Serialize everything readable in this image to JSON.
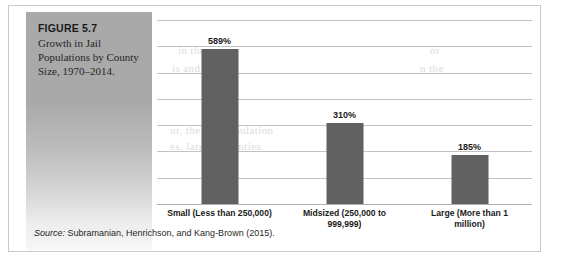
{
  "figure": {
    "number_label": "FIGURE 5.7",
    "caption": "Growth in Jail Populations by County Size, 1970–2014."
  },
  "source": {
    "label": "Source:",
    "citation": " Subramanian, Henrichson, and Kang-Brown (2015)."
  },
  "colors": {
    "bar": "#616161",
    "caption_panel": "#a9a9a9",
    "gridline": "#c2c2c2",
    "border": "#c9c9c9"
  },
  "bleed_text": {
    "line1": "in the",
    "line2": "is and by",
    "line3": "or",
    "line4": "n the",
    "line5": "ur, the jail population",
    "line6": "es, largest counties",
    "line7": "ncts in jail that",
    "line8": "ncreased in small",
    "line9": "little over the 1970s"
  },
  "chart_data": {
    "type": "bar",
    "title": "",
    "xlabel": "",
    "ylabel": "",
    "categories": [
      "Small (Less than 250,000)",
      "Midsized (250,000 to 999,999)",
      "Large (More than 1 million)"
    ],
    "category_lines": [
      [
        "Small (Less than 250,000)"
      ],
      [
        "Midsized (250,000 to",
        "999,999)"
      ],
      [
        "Large (More than 1",
        "million)"
      ]
    ],
    "values": [
      589,
      310,
      185
    ],
    "value_labels": [
      "589%",
      "310%",
      "185%"
    ],
    "ylim": [
      0,
      700
    ],
    "gridlines": [
      0,
      100,
      200,
      300,
      400,
      500,
      600,
      700
    ],
    "grid": true,
    "legend": "none",
    "unit": "%"
  }
}
